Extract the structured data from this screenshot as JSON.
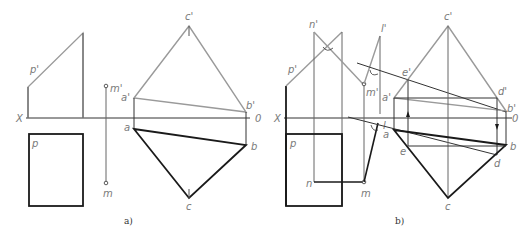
{
  "figure": {
    "colors": {
      "background": "#ffffff",
      "thick_line": "#1a1a1a",
      "thin_line": "#444444",
      "gray_line": "#9a9a9a",
      "label": "#7a7a7a"
    },
    "panel_a": {
      "caption": "a)",
      "axis": {
        "left": "X",
        "right": "0"
      },
      "labels": {
        "p_prime": "p'",
        "p": "p",
        "m_prime": "m'",
        "m": "m",
        "a_prime": "a'",
        "b_prime": "b'",
        "c_prime": "c'",
        "a": "a",
        "b": "b",
        "c": "c"
      }
    },
    "panel_b": {
      "caption": "b)",
      "axis": {
        "left": "X",
        "right": "0"
      },
      "labels": {
        "n_prime": "n'",
        "p_prime": "p'",
        "p": "p",
        "n": "n",
        "l_prime": "l'",
        "l": "l",
        "m_prime": "m'",
        "m": "m",
        "a_prime": "a'",
        "b_prime": "b'",
        "c_prime": "c'",
        "d_prime": "d'",
        "e_prime": "e'",
        "a": "a",
        "b": "b",
        "c": "c",
        "d": "d",
        "e": "e"
      }
    }
  }
}
